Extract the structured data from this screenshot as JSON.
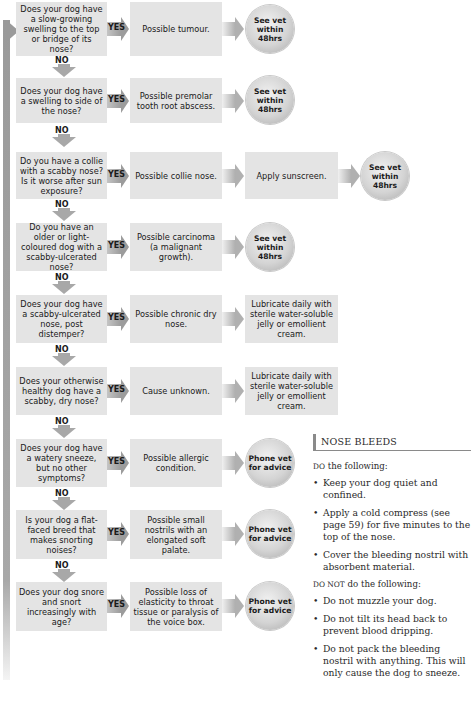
{
  "flowchart": {
    "yes_label": "YES",
    "no_label": "NO",
    "rows": [
      {
        "question": "Does your dog have a slow-growing swelling to the top or bridge of its nose?",
        "result": "Possible tumour.",
        "action": null,
        "outcome": "See vet within 48hrs"
      },
      {
        "question": "Does your dog have a swelling to side of the nose?",
        "result": "Possible premolar tooth root abscess.",
        "action": null,
        "outcome": "See vet within 48hrs"
      },
      {
        "question": "Do you have a collie with a scabby nose? Is it worse after sun exposure?",
        "result": "Possible collie nose.",
        "action": "Apply sunscreen.",
        "outcome": "See vet within 48hrs"
      },
      {
        "question": "Do you have an older or light-coloured dog with a scabby-ulcerated nose?",
        "result": "Possible carcinoma (a malignant growth).",
        "action": null,
        "outcome": "See vet within 48hrs"
      },
      {
        "question": "Does your dog have a scabby-ulcerated nose, post distemper?",
        "result": "Possible chronic dry nose.",
        "action": "Lubricate daily with sterile water-soluble jelly or emollient cream.",
        "outcome": null
      },
      {
        "question": "Does your otherwise healthy dog have a scabby, dry nose?",
        "result": "Cause unknown.",
        "action": "Lubricate daily with sterile water-soluble jelly or emollient cream.",
        "outcome": null
      },
      {
        "question": "Does your dog have a watery sneeze, but no other symptoms?",
        "result": "Possible allergic condition.",
        "action": null,
        "outcome": "Phone vet for advice"
      },
      {
        "question": "Is your dog a flat-faced breed that makes snorting noises?",
        "result": "Possible small nostrils with an elongated soft palate.",
        "action": null,
        "outcome": "Phone vet for advice"
      },
      {
        "question": "Does your dog snore and snort increasingly with age?",
        "result": "Possible loss of elasticity to throat tissue or paralysis of the voice box.",
        "action": null,
        "outcome": "Phone vet for advice"
      }
    ]
  },
  "nose_bleeds": {
    "title": "NOSE BLEEDS",
    "do_prefix": "DO",
    "do_suffix": " the following:",
    "do_items": [
      "Keep your dog quiet and confined.",
      "Apply a cold compress (see page 59) for five minutes to the top of the nose.",
      "Cover the bleeding nostril with absorbent material."
    ],
    "dont_prefix": "DO NOT",
    "dont_suffix": " do the following:",
    "dont_items": [
      "Do not muzzle your dog.",
      "Do not tilt its head back to prevent blood dripping.",
      "Do not pack the bleeding nostril with anything. This will only cause the dog to sneeze."
    ]
  }
}
